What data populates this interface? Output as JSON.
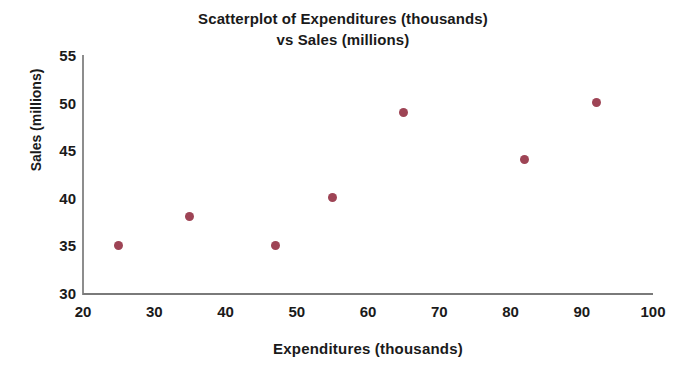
{
  "chart_data": {
    "type": "scatter",
    "title": "Scatterplot of Expenditures (thousands) vs Sales (millions)",
    "title_lines": [
      "Scatterplot of Expenditures (thousands)",
      "vs Sales (millions)"
    ],
    "xlabel": "Expenditures (thousands)",
    "ylabel": "Sales (millions)",
    "xlim": [
      20,
      100
    ],
    "ylim": [
      30,
      55
    ],
    "xticks": [
      20,
      30,
      40,
      50,
      60,
      70,
      80,
      90,
      100
    ],
    "xtick_labels": [
      "20",
      "30",
      "40",
      "50",
      "60",
      "70",
      "80",
      "90",
      "100"
    ],
    "yticks": [
      30,
      35,
      40,
      45,
      50,
      55
    ],
    "ytick_labels": [
      "30",
      "35",
      "40",
      "45",
      "50",
      "55"
    ],
    "grid": false,
    "legend": false,
    "marker_color": "#9e4455",
    "axis_color": "#7a7a7a",
    "text_color": "#1a1a1a",
    "background": "#ffffff",
    "series": [
      {
        "name": "Expenditures vs Sales",
        "points": [
          {
            "x": 25,
            "y": 35
          },
          {
            "x": 35,
            "y": 38
          },
          {
            "x": 47,
            "y": 35
          },
          {
            "x": 55,
            "y": 40
          },
          {
            "x": 65,
            "y": 49
          },
          {
            "x": 82,
            "y": 44
          },
          {
            "x": 92,
            "y": 50
          }
        ]
      }
    ]
  }
}
